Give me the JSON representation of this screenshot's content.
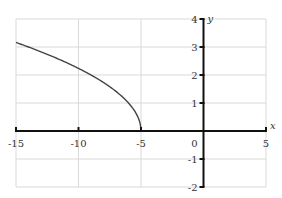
{
  "chart_data": {
    "type": "line",
    "title": "",
    "function": "y = sqrt(-(x + 5))",
    "xlabel": "x",
    "ylabel": "y",
    "xlim": [
      -15,
      5
    ],
    "ylim": [
      -2,
      4
    ],
    "grid": true,
    "x_ticks": [
      -15,
      -10,
      -5,
      0,
      5
    ],
    "y_ticks": [
      -2,
      -1,
      0,
      1,
      2,
      3,
      4
    ],
    "x_tick_labels": [
      "-15",
      "-10",
      "-5",
      "0",
      "5"
    ],
    "y_tick_labels": [
      "-2",
      "-1",
      "1",
      "2",
      "3",
      "4"
    ],
    "origin_label": "0",
    "series": [
      {
        "name": "curve",
        "x": [
          -15,
          -14,
          -13,
          -12,
          -11,
          -10,
          -9,
          -8,
          -7,
          -6,
          -5.5,
          -5
        ],
        "y": [
          3.16,
          3.0,
          2.83,
          2.65,
          2.45,
          2.24,
          2.0,
          1.73,
          1.41,
          1.0,
          0.71,
          0
        ]
      }
    ],
    "colors": {
      "curve": "#444444",
      "axis": "#111111",
      "grid": "#d9d9d9"
    }
  }
}
